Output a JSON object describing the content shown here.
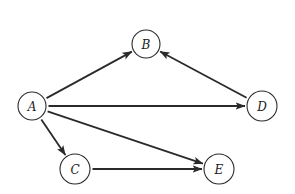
{
  "diagram": {
    "type": "directed-graph",
    "colors": {
      "stroke": "#2a2a2a",
      "background": "#ffffff",
      "text": "#222222"
    },
    "nodes": [
      {
        "id": "A",
        "label": "A",
        "x": 32,
        "y": 106,
        "r": 14
      },
      {
        "id": "B",
        "label": "B",
        "x": 146,
        "y": 44,
        "r": 14
      },
      {
        "id": "D",
        "label": "D",
        "x": 262,
        "y": 106,
        "r": 15
      },
      {
        "id": "C",
        "label": "C",
        "x": 75,
        "y": 169,
        "r": 15
      },
      {
        "id": "E",
        "label": "E",
        "x": 219,
        "y": 169,
        "r": 15
      }
    ],
    "edges": [
      {
        "from": "A",
        "to": "B"
      },
      {
        "from": "D",
        "to": "B"
      },
      {
        "from": "A",
        "to": "D"
      },
      {
        "from": "A",
        "to": "C"
      },
      {
        "from": "A",
        "to": "E"
      },
      {
        "from": "C",
        "to": "E"
      }
    ]
  }
}
